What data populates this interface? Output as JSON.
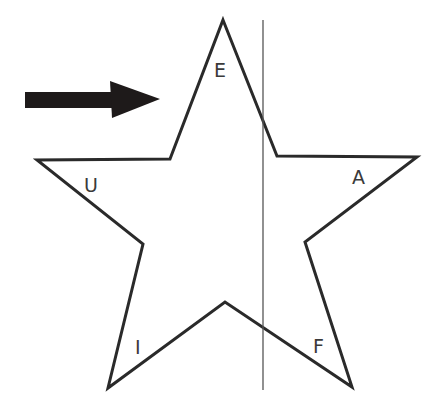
{
  "diagram": {
    "shape": "star",
    "labels": {
      "top": "E",
      "left": "U",
      "right": "A",
      "bottom_left": "I",
      "bottom_right": "F"
    },
    "arrow": {
      "direction": "right",
      "color": "#1e1a1a"
    },
    "line": {
      "orientation": "vertical",
      "style": "thin"
    },
    "colors": {
      "stroke": "#2a2a2a",
      "background": "#ffffff"
    }
  }
}
